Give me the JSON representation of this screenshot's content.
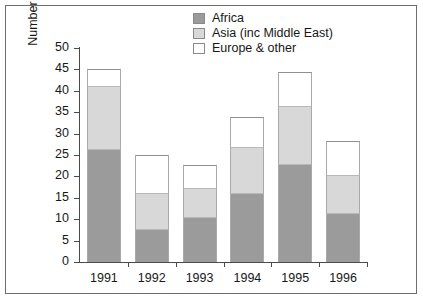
{
  "chart_data": {
    "type": "bar",
    "subtype": "stacked-bar",
    "title": "",
    "xlabel": "",
    "ylabel": "Number of principal applicants (× 10³)",
    "ylabel_base": "Number of principal applicants (× 10",
    "ylabel_exp": "3",
    "ylabel_tail": ")",
    "categories": [
      "1991",
      "1992",
      "1993",
      "1994",
      "1995",
      "1996"
    ],
    "series": [
      {
        "name": "Africa",
        "color": "#9b9b9b",
        "values": [
          26.5,
          7.7,
          10.5,
          16.2,
          22.8,
          11.4
        ]
      },
      {
        "name": "Asia (inc Middle East)",
        "color": "#d8d8d8",
        "values": [
          14.7,
          8.5,
          6.8,
          10.6,
          13.6,
          9.0
        ]
      },
      {
        "name": "Europe & other",
        "color": "#ffffff",
        "values": [
          4.0,
          8.9,
          5.4,
          7.0,
          7.9,
          7.8
        ]
      }
    ],
    "totals": [
      45.2,
      25.1,
      22.7,
      33.8,
      44.3,
      28.2
    ],
    "stack_tops": {
      "africa": [
        26.5,
        7.7,
        10.5,
        16.2,
        22.8,
        11.4
      ],
      "asia": [
        41.2,
        16.2,
        17.3,
        26.8,
        36.4,
        20.4
      ],
      "total": [
        45.2,
        25.1,
        22.7,
        33.8,
        44.3,
        28.2
      ]
    },
    "ylim": [
      0,
      50
    ],
    "y_ticks": [
      "0",
      "5",
      "10",
      "15",
      "20",
      "25",
      "30",
      "35",
      "40",
      "45",
      "50"
    ],
    "y_tick_values": [
      0,
      5,
      10,
      15,
      20,
      25,
      30,
      35,
      40,
      45,
      50
    ],
    "grid": false,
    "legend_position": "top-center"
  },
  "legend": {
    "items": [
      {
        "label": "Africa",
        "color": "#9b9b9b"
      },
      {
        "label": "Asia (inc Middle East)",
        "color": "#d8d8d8"
      },
      {
        "label": "Europe & other",
        "color": "#ffffff"
      }
    ]
  },
  "colors": {
    "africa": "#9b9b9b",
    "asia": "#d8d8d8",
    "europe": "#ffffff",
    "axis": "#4a4a4a",
    "frame": "#6e6e6e",
    "text": "#171717",
    "background": "#ffffff"
  }
}
